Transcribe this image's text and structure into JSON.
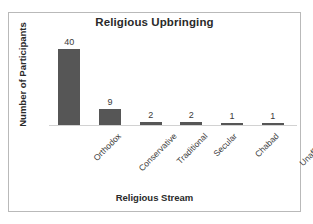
{
  "chart_data": {
    "type": "bar",
    "title": "Religious Upbringing",
    "xlabel": "Religious Stream",
    "ylabel": "Number of Participants",
    "categories": [
      "Orthodox",
      "Conservative",
      "Traditional",
      "Secular",
      "Chabad",
      "Unaffiliated"
    ],
    "values": [
      40,
      9,
      2,
      2,
      1,
      1
    ],
    "value_labels": [
      "40",
      "9",
      "2",
      "2",
      "1",
      "1"
    ],
    "ylim": [
      0,
      47
    ],
    "grid": false,
    "legend": "none",
    "bar_color": "#565656",
    "axis_color": "#d2d2d2",
    "text_color": "#2a2a2a",
    "background": "#ffffff",
    "border_color": "#b9b9b9"
  }
}
